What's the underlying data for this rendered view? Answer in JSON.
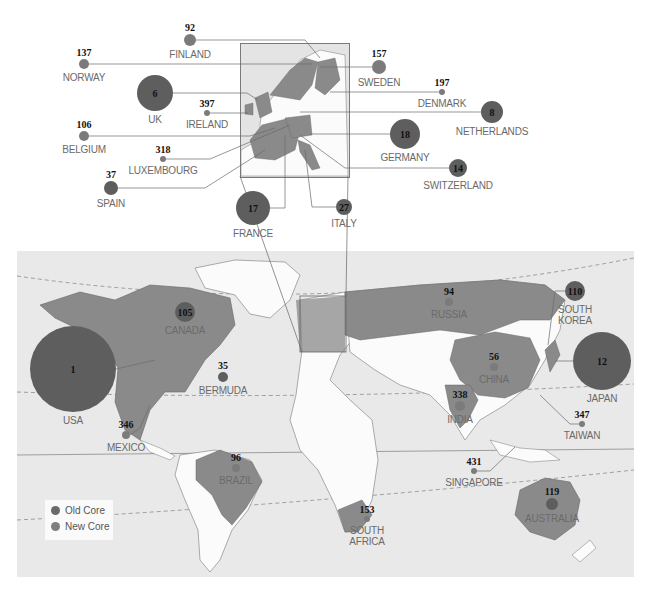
{
  "colors": {
    "old_core": "#5e5e5e",
    "new_core": "#7b7b7b",
    "highlight_country": "#8a8a8a",
    "ocean": "#e9e9e9",
    "land": "#fbfbfb",
    "leader_line": "#6a6a6a"
  },
  "legend": {
    "items": [
      {
        "label": "Old Core",
        "color": "#6a6a6a"
      },
      {
        "label": "New Core",
        "color": "#7e7e7e"
      }
    ]
  },
  "europe_inset": {
    "countries": [
      {
        "name": "FINLAND",
        "rank": "92",
        "x": 190,
        "y": 40,
        "r": 6,
        "core": "new"
      },
      {
        "name": "NORWAY",
        "rank": "137",
        "x": 84,
        "y": 64,
        "r": 5,
        "core": "new"
      },
      {
        "name": "UK",
        "rank": "6",
        "x": 155,
        "y": 93,
        "r": 18,
        "core": "old"
      },
      {
        "name": "IRELAND",
        "rank": "397",
        "x": 207,
        "y": 113,
        "r": 3,
        "core": "new"
      },
      {
        "name": "BELGIUM",
        "rank": "106",
        "x": 84,
        "y": 136,
        "r": 5,
        "core": "new"
      },
      {
        "name": "LUXEMBOURG",
        "rank": "318",
        "x": 163,
        "y": 159,
        "r": 3,
        "core": "new"
      },
      {
        "name": "SPAIN",
        "rank": "37",
        "x": 111,
        "y": 188,
        "r": 7,
        "core": "old"
      },
      {
        "name": "FRANCE",
        "rank": "17",
        "x": 253,
        "y": 208,
        "r": 17,
        "core": "old"
      },
      {
        "name": "ITALY",
        "rank": "27",
        "x": 344,
        "y": 207,
        "r": 8,
        "core": "old"
      },
      {
        "name": "SWEDEN",
        "rank": "157",
        "x": 379,
        "y": 67,
        "r": 7,
        "core": "new"
      },
      {
        "name": "DENMARK",
        "rank": "197",
        "x": 442,
        "y": 92,
        "r": 3,
        "core": "new"
      },
      {
        "name": "NETHERLANDS",
        "rank": "8",
        "x": 492,
        "y": 112,
        "r": 11,
        "core": "old"
      },
      {
        "name": "GERMANY",
        "rank": "18",
        "x": 405,
        "y": 134,
        "r": 15,
        "core": "old"
      },
      {
        "name": "SWITZERLAND",
        "rank": "14",
        "x": 458,
        "y": 168,
        "r": 9,
        "core": "old"
      }
    ]
  },
  "world": {
    "countries": [
      {
        "name": "USA",
        "rank": "1",
        "x": 73,
        "y": 369,
        "r": 43,
        "core": "old"
      },
      {
        "name": "CANADA",
        "rank": "105",
        "x": 185,
        "y": 312,
        "r": 10,
        "core": "old"
      },
      {
        "name": "BERMUDA",
        "rank": "35",
        "x": 223,
        "y": 377,
        "r": 5,
        "core": "old"
      },
      {
        "name": "MEXICO",
        "rank": "346",
        "x": 126,
        "y": 435,
        "r": 4,
        "core": "new"
      },
      {
        "name": "BRAZIL",
        "rank": "96",
        "x": 236,
        "y": 468,
        "r": 4,
        "core": "new"
      },
      {
        "name": "RUSSIA",
        "rank": "94",
        "x": 449,
        "y": 302,
        "r": 4,
        "core": "new"
      },
      {
        "name": "CHINA",
        "rank": "56",
        "x": 494,
        "y": 367,
        "r": 4,
        "core": "new"
      },
      {
        "name": "INDIA",
        "rank": "338",
        "x": 460,
        "y": 406,
        "r": 5,
        "core": "new"
      },
      {
        "name": "SOUTH KOREA",
        "rank": "110",
        "x": 575,
        "y": 291,
        "r": 10,
        "core": "old"
      },
      {
        "name": "JAPAN",
        "rank": "12",
        "x": 602,
        "y": 361,
        "r": 29,
        "core": "old"
      },
      {
        "name": "TAIWAN",
        "rank": "347",
        "x": 582,
        "y": 424,
        "r": 3,
        "core": "new"
      },
      {
        "name": "SINGAPORE",
        "rank": "431",
        "x": 474,
        "y": 471,
        "r": 3,
        "core": "new"
      },
      {
        "name": "SOUTH AFRICA",
        "rank": "153",
        "x": 367,
        "y": 519,
        "r": 3,
        "core": "new"
      },
      {
        "name": "AUSTRALIA",
        "rank": "119",
        "x": 552,
        "y": 504,
        "r": 6,
        "core": "old"
      }
    ]
  }
}
